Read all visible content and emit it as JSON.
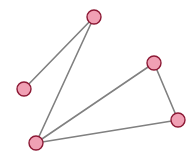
{
  "diagram": {
    "type": "node-link-graph",
    "width": 195,
    "height": 155,
    "background_color": "#ffffff",
    "node_style": {
      "fill_color": "#f0a0b4",
      "border_color": "#8c1834",
      "border_width": 1.4,
      "radius": 7
    },
    "edge_style": {
      "stroke_color": "#808080",
      "stroke_width": 1.6
    },
    "nodes": [
      {
        "id": "n1",
        "label": "",
        "x": 94,
        "y": 17
      },
      {
        "id": "n2",
        "label": "",
        "x": 24,
        "y": 89
      },
      {
        "id": "n3",
        "label": "",
        "x": 36,
        "y": 143
      },
      {
        "id": "n4",
        "label": "",
        "x": 154,
        "y": 63
      },
      {
        "id": "n5",
        "label": "",
        "x": 178,
        "y": 120
      }
    ],
    "edges": [
      {
        "id": "e1",
        "source": "n1",
        "target": "n2"
      },
      {
        "id": "e2",
        "source": "n1",
        "target": "n3"
      },
      {
        "id": "e3",
        "source": "n3",
        "target": "n4"
      },
      {
        "id": "e4",
        "source": "n3",
        "target": "n5"
      },
      {
        "id": "e5",
        "source": "n4",
        "target": "n5"
      }
    ]
  }
}
